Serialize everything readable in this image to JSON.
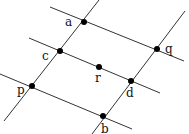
{
  "diagram": {
    "colors": {
      "line": "#333333",
      "point": "#000000",
      "background": "#ffffff"
    },
    "lines": [
      {
        "id": "line-aq",
        "x1": 50,
        "y1": 7,
        "x2": 184,
        "y2": 61
      },
      {
        "id": "line-crd",
        "x1": 29,
        "y1": 38,
        "x2": 160,
        "y2": 93
      },
      {
        "id": "line-pb",
        "x1": 0,
        "y1": 74,
        "x2": 132,
        "y2": 129
      },
      {
        "id": "line-acp",
        "x1": 99,
        "y1": 0,
        "x2": 4,
        "y2": 121
      },
      {
        "id": "line-qdb",
        "x1": 185,
        "y1": 11,
        "x2": 92,
        "y2": 134
      }
    ],
    "points": [
      {
        "label": "a",
        "x": 84,
        "y": 22,
        "lx": 65,
        "ly": 26
      },
      {
        "label": "q",
        "x": 157,
        "y": 49,
        "lx": 165,
        "ly": 53
      },
      {
        "label": "c",
        "x": 60,
        "y": 51,
        "lx": 42,
        "ly": 60
      },
      {
        "label": "r",
        "x": 99,
        "y": 67,
        "lx": 95,
        "ly": 82
      },
      {
        "label": "d",
        "x": 131,
        "y": 81,
        "lx": 126,
        "ly": 97
      },
      {
        "label": "p",
        "x": 32,
        "y": 86,
        "lx": 17,
        "ly": 94
      },
      {
        "label": "b",
        "x": 103,
        "y": 116,
        "lx": 101,
        "ly": 133
      }
    ]
  }
}
